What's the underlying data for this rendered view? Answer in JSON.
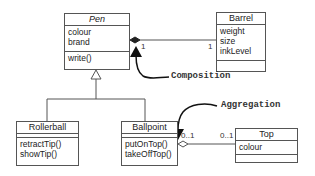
{
  "classes": {
    "pen": {
      "name": "Pen",
      "abstract": true,
      "attributes": [
        "colour",
        "brand"
      ],
      "operations": [
        "write()"
      ]
    },
    "barrel": {
      "name": "Barrel",
      "attributes": [
        "weight",
        "size",
        "inkLevel"
      ],
      "operations": []
    },
    "rollerball": {
      "name": "Rollerball",
      "attributes": [],
      "operations": [
        "retractTip()",
        "showTip()"
      ]
    },
    "ballpoint": {
      "name": "Ballpoint",
      "attributes": [],
      "operations": [
        "putOnTop()",
        "takeOffTop()"
      ]
    },
    "top": {
      "name": "Top",
      "attributes": [
        "colour"
      ],
      "operations": []
    }
  },
  "relationships": {
    "composition": {
      "label": "Composition",
      "from": "Pen",
      "to": "Barrel",
      "mult_pen": "1",
      "mult_barrel": "1"
    },
    "aggregation": {
      "label": "Aggregation",
      "from": "Ballpoint",
      "to": "Top",
      "mult_ballpoint": "0..1",
      "mult_top": "0..1"
    },
    "generalization": {
      "parent": "Pen",
      "children": [
        "Rollerball",
        "Ballpoint"
      ]
    }
  },
  "colors": {
    "line": "#555555",
    "arrow": "#111111",
    "text": "#222222"
  }
}
